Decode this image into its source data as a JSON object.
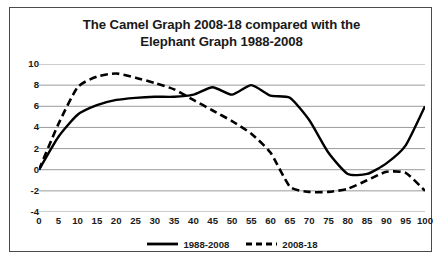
{
  "chart_data": {
    "type": "line",
    "title": "The Camel Graph 2008-18 compared with the Elephant Graph 1988-2008",
    "title_lines": [
      "The Camel Graph 2008-18 compared with the",
      "Elephant Graph 1988-2008"
    ],
    "xlabel": "",
    "ylabel": "",
    "xlim": [
      0,
      100
    ],
    "ylim": [
      -4,
      10
    ],
    "grid": true,
    "legend_position": "bottom",
    "x": [
      0,
      5,
      10,
      15,
      20,
      25,
      30,
      35,
      40,
      45,
      50,
      55,
      60,
      65,
      70,
      75,
      80,
      85,
      90,
      95,
      100
    ],
    "categories": [
      "0",
      "5",
      "10",
      "15",
      "20",
      "25",
      "30",
      "35",
      "40",
      "45",
      "50",
      "55",
      "60",
      "65",
      "70",
      "75",
      "80",
      "85",
      "90",
      "95",
      "100"
    ],
    "yticks": [
      10,
      8,
      6,
      4,
      2,
      0,
      -2,
      -4
    ],
    "series": [
      {
        "name": "1988-2008",
        "style": "solid",
        "color": "#000000",
        "values": [
          0,
          3.1,
          5.2,
          6.1,
          6.6,
          6.8,
          6.9,
          6.9,
          7.1,
          7.8,
          7.1,
          8.0,
          7.0,
          6.8,
          4.7,
          1.6,
          -0.4,
          -0.4,
          0.6,
          2.3,
          6.0
        ]
      },
      {
        "name": "2008-18",
        "style": "dashed",
        "color": "#000000",
        "values": [
          0,
          4.3,
          7.8,
          8.8,
          9.1,
          8.7,
          8.2,
          7.6,
          6.6,
          5.6,
          4.6,
          3.4,
          1.6,
          -1.6,
          -2.1,
          -2.1,
          -1.8,
          -1.0,
          -0.2,
          -0.3,
          -2.0
        ]
      }
    ]
  },
  "legend": {
    "entries": [
      {
        "label": "1988-2008",
        "style": "solid"
      },
      {
        "label": "2008-18",
        "style": "dashed"
      }
    ]
  },
  "bottom_caption": ""
}
